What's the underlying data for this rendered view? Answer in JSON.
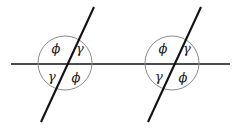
{
  "figure": {
    "background_color": "#ffffff",
    "width": 240,
    "height": 128,
    "baseline": {
      "label": "horizontal-line",
      "x1": 11,
      "y1": 64,
      "x2": 230,
      "y2": 64,
      "color": "#4c4c4c",
      "stroke_width": 2
    },
    "circle_color": "#8a8a8a",
    "transversal_color": "#121212",
    "label_color": "#1a1a1a",
    "intersections": [
      {
        "name": "left-intersection",
        "circle": {
          "cx": 65,
          "cy": 63,
          "r": 27
        },
        "transversal": {
          "x1": 41,
          "y1": 122,
          "x2": 94,
          "y2": 7
        },
        "labels": [
          {
            "position": "upper-left",
            "text": "ϕ",
            "x": 56,
            "y": 49
          },
          {
            "position": "upper-right",
            "text": "γ",
            "x": 80,
            "y": 49
          },
          {
            "position": "lower-left",
            "text": "γ",
            "x": 52,
            "y": 77
          },
          {
            "position": "lower-right",
            "text": "ϕ",
            "x": 76,
            "y": 78
          }
        ]
      },
      {
        "name": "right-intersection",
        "circle": {
          "cx": 172,
          "cy": 63,
          "r": 27
        },
        "transversal": {
          "x1": 148,
          "y1": 122,
          "x2": 201,
          "y2": 7
        },
        "labels": [
          {
            "position": "upper-left",
            "text": "ϕ",
            "x": 163,
            "y": 49
          },
          {
            "position": "upper-right",
            "text": "γ",
            "x": 187,
            "y": 49
          },
          {
            "position": "lower-left",
            "text": "γ",
            "x": 159,
            "y": 77
          },
          {
            "position": "lower-right",
            "text": "ϕ",
            "x": 183,
            "y": 78
          }
        ]
      }
    ]
  }
}
